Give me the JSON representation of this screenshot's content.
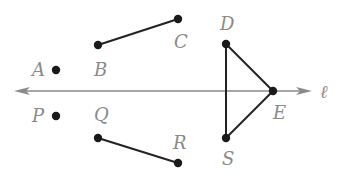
{
  "colors": {
    "line": "#8a8a8a",
    "segment": "#222222",
    "point": "#1a1a1a",
    "label": "#8a8a8a",
    "background": "#ffffff"
  },
  "line": {
    "name": "ℓ",
    "label": "ℓ",
    "x1": 14,
    "x2": 312,
    "y": 91,
    "label_x": 320,
    "label_y": 98
  },
  "points": [
    {
      "id": "A",
      "label": "A",
      "x": 56,
      "y": 70,
      "lx": 32,
      "ly": 76
    },
    {
      "id": "B",
      "label": "B",
      "x": 98,
      "y": 45,
      "lx": 94,
      "ly": 76
    },
    {
      "id": "C",
      "label": "C",
      "x": 178,
      "y": 19,
      "lx": 174,
      "ly": 48
    },
    {
      "id": "D",
      "label": "D",
      "x": 226,
      "y": 44,
      "lx": 220,
      "ly": 30
    },
    {
      "id": "E",
      "label": "E",
      "x": 273,
      "y": 91,
      "lx": 273,
      "ly": 119
    },
    {
      "id": "S",
      "label": "S",
      "x": 226,
      "y": 138,
      "lx": 222,
      "ly": 165
    },
    {
      "id": "P",
      "label": "P",
      "x": 56,
      "y": 116,
      "lx": 32,
      "ly": 122
    },
    {
      "id": "Q",
      "label": "Q",
      "x": 98,
      "y": 138,
      "lx": 94,
      "ly": 121
    },
    {
      "id": "R",
      "label": "R",
      "x": 178,
      "y": 163,
      "lx": 173,
      "ly": 149
    }
  ],
  "segments": [
    {
      "from": "B",
      "to": "C"
    },
    {
      "from": "D",
      "to": "E"
    },
    {
      "from": "D",
      "to": "S"
    },
    {
      "from": "E",
      "to": "S"
    },
    {
      "from": "Q",
      "to": "R"
    }
  ]
}
